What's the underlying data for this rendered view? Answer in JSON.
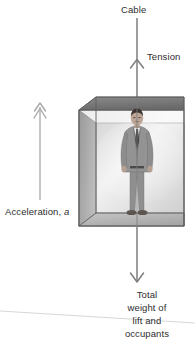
{
  "diagram": {
    "background_color": "#ffffff",
    "text_color": "#2e2e2e",
    "labels": {
      "cable": "Cable",
      "tension": "Tension",
      "acceleration_prefix": "Acceleration, ",
      "acceleration_symbol": "a",
      "weight_lines": [
        "Total",
        "weight of",
        "lift and",
        "occupants"
      ]
    },
    "arrows": [
      {
        "name": "tension-arrow",
        "direction": "up",
        "color": "#7a7a7a",
        "label": "Tension",
        "head_style": "open-chevron"
      },
      {
        "name": "acceleration-arrow",
        "direction": "up",
        "color": "#a3a3a3",
        "label": "Acceleration, a",
        "head_style": "double-chevron"
      },
      {
        "name": "weight-arrow",
        "direction": "down",
        "color": "#7a7a7a",
        "label": "Total weight of lift and occupants",
        "head_style": "open-chevron"
      }
    ],
    "lift": {
      "name": "lift-box",
      "shape": "cube-in-perspective",
      "face_color": "#d3d3d3",
      "side_color": "#8e8e8e",
      "top_color": "#6f6f6f",
      "floor_color": "#9b9b9b",
      "edge_color": "#5e5e5e"
    },
    "occupant": {
      "name": "occupant-figure",
      "description": "man standing in a grey suit with dark tie",
      "suit_color": "#8d8d8d",
      "tie_color": "#3a3a3a",
      "skin_color": "#b9a394",
      "hair_color": "#3b3532",
      "shoe_color": "#5a5350"
    },
    "ground_line": {
      "name": "horizon-line",
      "color": "#cfcfcf"
    }
  }
}
